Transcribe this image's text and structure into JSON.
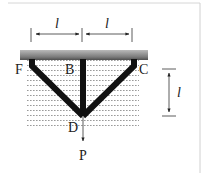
{
  "diagram": {
    "type": "three-bar truss",
    "nodes": {
      "F": "F",
      "B": "B",
      "C": "C",
      "D": "D"
    },
    "load_label": "P",
    "dimensions": {
      "left_span": "l",
      "right_span": "l",
      "height": "l"
    },
    "colors": {
      "bars": "#111111",
      "ceiling_top": "#5a5a5a",
      "ceiling_bottom": "#c8c8c8",
      "hatch": "#9a9a9a",
      "frame": "#d0d0d0"
    }
  }
}
